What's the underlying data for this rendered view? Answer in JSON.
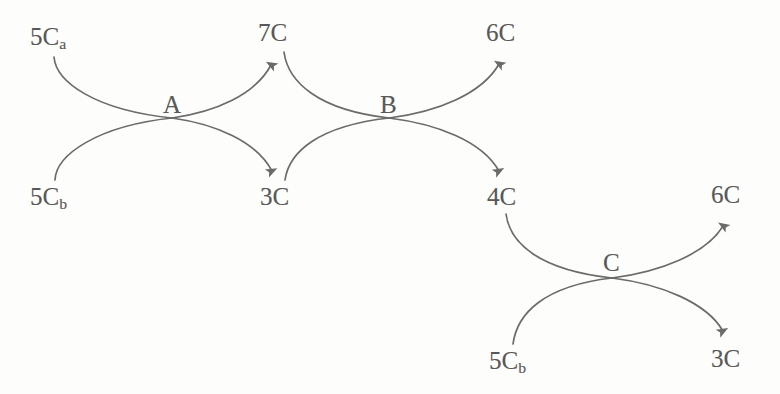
{
  "diagram": {
    "type": "reaction-flow",
    "stroke_color": "#6b6b6b",
    "text_color": "#595959",
    "background_color": "#fdfdfb",
    "nodes": [
      {
        "id": "A",
        "label": "A",
        "x": 172,
        "y": 118,
        "inputs": [
          "5C_a",
          "5C_b"
        ],
        "outputs": [
          "7C",
          "3C"
        ]
      },
      {
        "id": "B",
        "label": "B",
        "x": 389,
        "y": 118,
        "inputs": [
          "7C",
          "3C"
        ],
        "outputs": [
          "6C",
          "4C"
        ]
      },
      {
        "id": "C",
        "label": "C",
        "x": 612,
        "y": 278,
        "inputs": [
          "4C",
          "5C_b"
        ],
        "outputs": [
          "6C",
          "3C"
        ]
      }
    ],
    "metabolites": [
      {
        "id": "m-5ca-left",
        "base": "5C",
        "sub": "a",
        "x": 30,
        "y": 24,
        "role": "input",
        "node": "A"
      },
      {
        "id": "m-5cb-left",
        "base": "5C",
        "sub": "b",
        "x": 30,
        "y": 184,
        "role": "input",
        "node": "A"
      },
      {
        "id": "m-7c",
        "base": "7C",
        "sub": "",
        "x": 258,
        "y": 20,
        "role": "output",
        "node": "A"
      },
      {
        "id": "m-3c-mid",
        "base": "3C",
        "sub": "",
        "x": 260,
        "y": 184,
        "role": "output",
        "node": "A"
      },
      {
        "id": "m-6c-top",
        "base": "6C",
        "sub": "",
        "x": 486,
        "y": 20,
        "role": "output",
        "node": "B"
      },
      {
        "id": "m-4c",
        "base": "4C",
        "sub": "",
        "x": 487,
        "y": 184,
        "role": "output",
        "node": "B"
      },
      {
        "id": "m-5cb-right",
        "base": "5C",
        "sub": "b",
        "x": 489,
        "y": 348,
        "role": "input",
        "node": "C"
      },
      {
        "id": "m-6c-right",
        "base": "6C",
        "sub": "",
        "x": 711,
        "y": 182,
        "role": "output",
        "node": "C"
      },
      {
        "id": "m-3c-right",
        "base": "3C",
        "sub": "",
        "x": 711,
        "y": 346,
        "role": "output",
        "node": "C"
      }
    ],
    "edges": [
      {
        "id": "e-5ca-to-A",
        "from": "5C_a",
        "to": "A",
        "direction": "into-node",
        "arrowhead": false
      },
      {
        "id": "e-5cb-to-A",
        "from": "5C_b",
        "to": "A",
        "direction": "into-node",
        "arrowhead": false
      },
      {
        "id": "e-A-to-7C",
        "from": "A",
        "to": "7C",
        "direction": "out-of-node",
        "arrowhead": true
      },
      {
        "id": "e-A-to-3C",
        "from": "A",
        "to": "3C",
        "direction": "out-of-node",
        "arrowhead": true
      },
      {
        "id": "e-7C-to-B",
        "from": "7C",
        "to": "B",
        "direction": "into-node",
        "arrowhead": false
      },
      {
        "id": "e-3C-to-B",
        "from": "3C",
        "to": "B",
        "direction": "into-node",
        "arrowhead": false
      },
      {
        "id": "e-B-to-6C",
        "from": "B",
        "to": "6C",
        "direction": "out-of-node",
        "arrowhead": true
      },
      {
        "id": "e-B-to-4C",
        "from": "B",
        "to": "4C",
        "direction": "out-of-node",
        "arrowhead": true
      },
      {
        "id": "e-4C-to-C",
        "from": "4C",
        "to": "C",
        "direction": "into-node",
        "arrowhead": false
      },
      {
        "id": "e-5cb-to-C",
        "from": "5C_b",
        "to": "C",
        "direction": "into-node",
        "arrowhead": false
      },
      {
        "id": "e-C-to-6C",
        "from": "C",
        "to": "6C",
        "direction": "out-of-node",
        "arrowhead": true
      },
      {
        "id": "e-C-to-3C",
        "from": "C",
        "to": "3C",
        "direction": "out-of-node",
        "arrowhead": true
      }
    ]
  }
}
